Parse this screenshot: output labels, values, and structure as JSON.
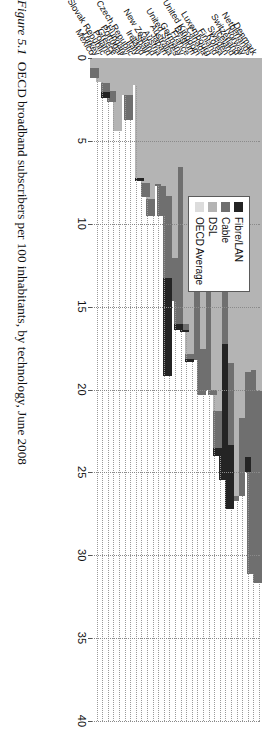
{
  "caption": {
    "figure_number": "Figure 5.1",
    "text": "OECD broadband subscribers per 100 inhabitants, by technology, June 2008"
  },
  "legend": {
    "position": "upper-left-inside",
    "items": [
      {
        "label": "Fibre/LAN",
        "color": "#242424"
      },
      {
        "label": "Cable",
        "color": "#6f6f6f"
      },
      {
        "label": "DSL",
        "color": "#b4b4b4"
      },
      {
        "label": "OECD Average",
        "color": "#dcdcdc"
      }
    ]
  },
  "axis": {
    "ticks": [
      "0",
      "5",
      "10",
      "15",
      "20",
      "25",
      "30",
      "35",
      "40"
    ],
    "min": 0,
    "max": 40,
    "grid": true
  },
  "chart_data": {
    "type": "bar",
    "orientation": "horizontal-stacked",
    "title": "OECD broadband subscribers per 100 inhabitants, by technology, June 2008",
    "xlabel": "",
    "ylabel": "",
    "xlim": [
      0,
      40
    ],
    "grid": true,
    "legend_position": "upper-left-inside",
    "categories": [
      "Denmark",
      "Netherlands",
      "Norway",
      "Switzerland",
      "Iceland",
      "Sweden",
      "Korea",
      "Finland",
      "Luxembourg",
      "Canada",
      "United Kingdom",
      "Belgium",
      "France",
      "Germany",
      "United States",
      "Australia",
      "Japan",
      "Austria",
      "New Zealand",
      "Spain",
      "Ireland",
      "Italy",
      "Czech Republic",
      "Hungary",
      "Portugal",
      "Greece",
      "Poland",
      "Slovak Republic",
      "Turkey",
      "Mexico"
    ],
    "series": [
      {
        "name": "DSL",
        "color": "#b4b4b4",
        "values": [
          22.6,
          21.3,
          24.0,
          26.7,
          32.3,
          22.3,
          10.9,
          27.5,
          28.1,
          16.8,
          24.6,
          20.6,
          26.4,
          25.0,
          10.3,
          19.9,
          12.0,
          15.9,
          17.3,
          17.5,
          16.5,
          16.9,
          8.0,
          7.3,
          9.5,
          13.3,
          7.8,
          6.2,
          7.6,
          3.5
        ]
      },
      {
        "name": "Cable",
        "color": "#6f6f6f",
        "values": [
          13.0,
          14.0,
          6.5,
          5.8,
          0.4,
          6.0,
          10.7,
          2.9,
          0.4,
          11.5,
          3.9,
          6.4,
          0.4,
          0.5,
          14.8,
          4.3,
          7.2,
          3.6,
          0.3,
          2.0,
          1.8,
          0.0,
          0.0,
          4.9,
          0.0,
          0.0,
          2.5,
          2.2,
          0.0,
          3.5
        ]
      },
      {
        "name": "Fibre/LAN",
        "color": "#242424",
        "values": [
          0.0,
          0.0,
          1.1,
          0.0,
          0.0,
          4.7,
          10.3,
          0.6,
          0.0,
          0.0,
          0.0,
          0.0,
          0.3,
          0.2,
          0.5,
          0.0,
          8.5,
          0.0,
          0.0,
          0.0,
          0.0,
          0.3,
          0.0,
          0.0,
          0.0,
          0.0,
          0.0,
          1.4,
          0.0,
          0.0
        ]
      }
    ],
    "totals": [
      35.6,
      35.3,
      31.6,
      32.5,
      32.7,
      33.0,
      31.9,
      31.0,
      28.5,
      28.3,
      28.5,
      27.0,
      27.1,
      25.7,
      25.6,
      24.2,
      27.7,
      19.5,
      17.6,
      19.5,
      18.3,
      17.2,
      8.0,
      12.2,
      9.5,
      13.3,
      10.3,
      9.8,
      7.6,
      7.0
    ],
    "oecd_average": 20.4,
    "units": "subscribers per 100 inhabitants",
    "source_period": "June 2008"
  }
}
